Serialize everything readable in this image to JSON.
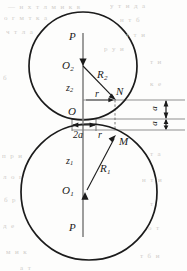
{
  "figure": {
    "background_color": "#fdfdfc",
    "stroke_color": "#1b1b1b",
    "guide_color": "#8a8a8a",
    "bleed_color": "#c9c6c2"
  },
  "labels": {
    "p_top": "P",
    "o2": "O",
    "o2_sub": "2",
    "z2": "z",
    "z2_sub": "2",
    "r2": "R",
    "r2_sub": "2",
    "r_upper": "r",
    "n": "N",
    "o": "O",
    "two_a": "2a",
    "r_lower": "r",
    "m": "M",
    "z1": "z",
    "z1_sub": "1",
    "r1": "R",
    "r1_sub": "1",
    "o1": "O",
    "o1_sub": "1",
    "p_bottom": "P",
    "gap_upper": "a",
    "gap_lower": "a"
  },
  "geometry": {
    "upper_circle": {
      "cx": 83,
      "cy": 66,
      "r": 54
    },
    "lower_circle": {
      "cx": 89,
      "cy": 192,
      "r": 68
    },
    "origin": {
      "x": 83,
      "y": 119
    },
    "point_n": {
      "x": 115,
      "y": 99
    },
    "point_m": {
      "x": 116,
      "y": 136
    },
    "axis_x": 83,
    "guide_lines_y": [
      100,
      119,
      130
    ],
    "guide_line_x2": 185
  },
  "bleed_text": {
    "rows": [
      {
        "x": 8,
        "y": 3,
        "text": "— н х т л м и к в"
      },
      {
        "x": 110,
        "y": 2,
        "text": "у т и д а"
      },
      {
        "x": 4,
        "y": 14,
        "text": "о г м т к а"
      },
      {
        "x": 120,
        "y": 16,
        "text": "н т б"
      },
      {
        "x": 6,
        "y": 28,
        "text": "ч т л а"
      },
      {
        "x": 126,
        "y": 31,
        "text": "т т и"
      },
      {
        "x": 104,
        "y": 45,
        "text": "р у и"
      },
      {
        "x": 150,
        "y": 58,
        "text": "т и"
      },
      {
        "x": 3,
        "y": 74,
        "text": "б"
      },
      {
        "x": 150,
        "y": 80,
        "text": "к е"
      },
      {
        "x": 2,
        "y": 152,
        "text": "п р и"
      },
      {
        "x": 150,
        "y": 150,
        "text": "т а"
      },
      {
        "x": 3,
        "y": 173,
        "text": "л о г"
      },
      {
        "x": 142,
        "y": 176,
        "text": "н т и"
      },
      {
        "x": 4,
        "y": 196,
        "text": "б р"
      },
      {
        "x": 150,
        "y": 200,
        "text": "т"
      },
      {
        "x": 3,
        "y": 222,
        "text": "д е"
      },
      {
        "x": 148,
        "y": 224,
        "text": "о т"
      },
      {
        "x": 6,
        "y": 248,
        "text": "м и к"
      },
      {
        "x": 140,
        "y": 252,
        "text": "т б и"
      },
      {
        "x": 20,
        "y": 264,
        "text": "а т"
      }
    ]
  }
}
